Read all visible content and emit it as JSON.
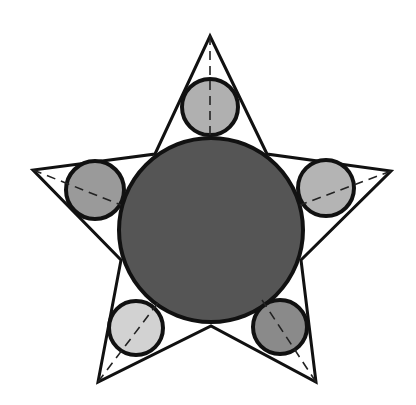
{
  "diagram": {
    "title": "",
    "star": {
      "stroke": "#111111",
      "fill": "#ffffff",
      "outer_points": [
        [
          210,
          36
        ],
        [
          391,
          171
        ],
        [
          316,
          382
        ],
        [
          98,
          382
        ],
        [
          33,
          170
        ]
      ],
      "inner_points": [
        [
          267,
          154
        ],
        [
          301,
          260
        ],
        [
          211,
          326
        ],
        [
          121,
          260
        ],
        [
          155,
          154
        ]
      ]
    },
    "center_circle": {
      "cx": 211,
      "cy": 230,
      "r": 92,
      "fill": "#555555",
      "stroke": "#111111"
    },
    "point_circles": [
      {
        "name": "top",
        "cx": 210,
        "cy": 107,
        "r": 28,
        "fill": "#b0b0b0"
      },
      {
        "name": "right",
        "cx": 326,
        "cy": 188,
        "r": 28,
        "fill": "#b4b4b4"
      },
      {
        "name": "bottom-right",
        "cx": 280,
        "cy": 327,
        "r": 27,
        "fill": "#8a8a8a"
      },
      {
        "name": "bottom-left",
        "cx": 136,
        "cy": 328,
        "r": 27,
        "fill": "#d2d2d2"
      },
      {
        "name": "left",
        "cx": 95,
        "cy": 190,
        "r": 29,
        "fill": "#9a9a9a"
      }
    ],
    "dashed_lines": [
      {
        "from": [
          210,
          36
        ],
        "to": [
          210,
          138
        ]
      },
      {
        "from": [
          391,
          171
        ],
        "to": [
          300,
          205
        ]
      },
      {
        "from": [
          316,
          382
        ],
        "to": [
          262,
          300
        ]
      },
      {
        "from": [
          98,
          382
        ],
        "to": [
          160,
          300
        ]
      },
      {
        "from": [
          33,
          170
        ],
        "to": [
          121,
          205
        ]
      }
    ]
  }
}
